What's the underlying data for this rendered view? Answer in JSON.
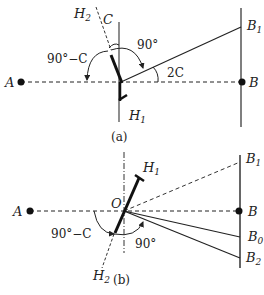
{
  "figure_a": {
    "caption": "(a)",
    "points": {
      "A": {
        "label": "A",
        "x": 21,
        "y": 82
      },
      "B": {
        "label": "B",
        "x": 242,
        "y": 82
      }
    },
    "labels": {
      "H2": {
        "main": "H",
        "sub": "2"
      },
      "H1": {
        "main": "H",
        "sub": "1"
      },
      "B1": {
        "main": "B",
        "sub": "1"
      },
      "C": "C",
      "angle_90": "90°",
      "angle_90_minus_C": "90°−C",
      "angle_2C": "2C"
    }
  },
  "figure_b": {
    "caption": "(b)",
    "points": {
      "A": {
        "label": "A",
        "x": 30,
        "y": 211
      },
      "B": {
        "label": "B",
        "x": 239,
        "y": 211
      },
      "O": {
        "label": "O",
        "x": 124,
        "y": 211
      }
    },
    "labels": {
      "H1": {
        "main": "H",
        "sub": "1"
      },
      "H2": {
        "main": "H",
        "sub": "2"
      },
      "B1": {
        "main": "B",
        "sub": "1"
      },
      "B0": {
        "main": "B",
        "sub": "0"
      },
      "B2": {
        "main": "B",
        "sub": "2"
      },
      "O": "O",
      "angle_90": "90°",
      "angle_90_minus_C": "90°−C"
    }
  },
  "colors": {
    "stroke": "#222222",
    "background": "#ffffff"
  }
}
